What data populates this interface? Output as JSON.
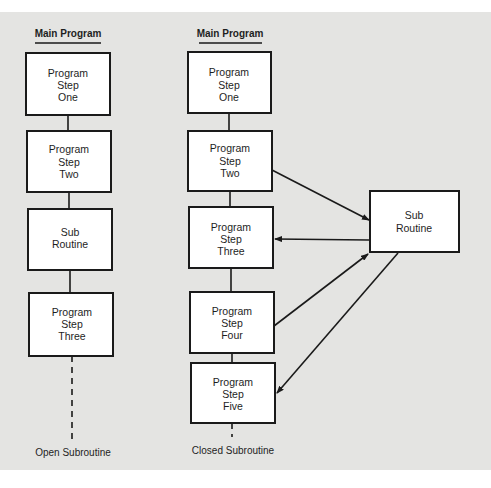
{
  "figure": {
    "background_color": "#e4e4e2",
    "box_fill": "#ffffff",
    "line_color": "#1a1a1a"
  },
  "open_subroutine": {
    "heading": "Main Program",
    "footer": "Open Subroutine",
    "boxes": [
      {
        "lines": [
          "Program",
          "Step",
          "One"
        ]
      },
      {
        "lines": [
          "Program",
          "Step",
          "Two"
        ]
      },
      {
        "lines": [
          "Sub",
          "Routine"
        ]
      },
      {
        "lines": [
          "Program",
          "Step",
          "Three"
        ]
      }
    ]
  },
  "closed_subroutine": {
    "heading": "Main Program",
    "footer": "Closed Subroutine",
    "boxes": [
      {
        "lines": [
          "Program",
          "Step",
          "One"
        ]
      },
      {
        "lines": [
          "Program",
          "Step",
          "Two"
        ]
      },
      {
        "lines": [
          "Program",
          "Step",
          "Three"
        ]
      },
      {
        "lines": [
          "Program",
          "Step",
          "Four"
        ]
      },
      {
        "lines": [
          "Program",
          "Step",
          "Five"
        ]
      }
    ],
    "subroutine_box": {
      "lines": [
        "Sub",
        "Routine"
      ]
    },
    "arrows": [
      {
        "from": "Program Step Two",
        "to": "Sub Routine"
      },
      {
        "from": "Sub Routine",
        "to": "Program Step Three"
      },
      {
        "from": "Program Step Four",
        "to": "Sub Routine"
      },
      {
        "from": "Sub Routine",
        "to": "Program Step Five"
      }
    ]
  }
}
